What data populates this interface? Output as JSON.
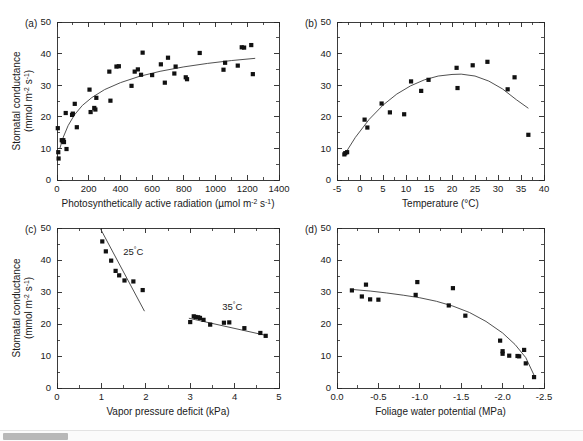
{
  "figure": {
    "background_color": "#ffffff",
    "marker_color": "#111111",
    "line_color": "#3c3c3c",
    "axis_color": "#262626",
    "shared_ylabel_line1": "Stomatal conductance",
    "shared_ylabel_line2_prefix": "(mmol m",
    "shared_ylabel_sup1": "-2",
    "shared_ylabel_mid": " s",
    "shared_ylabel_sup2": "-1",
    "shared_ylabel_suffix": ")"
  },
  "scrollbar": {
    "name": "horizontal-scrollbar",
    "thumb_left_px": 3,
    "thumb_width_px": 65,
    "track_color": "#fbfbfb",
    "thumb_color": "#b8b8b8"
  },
  "chart_data": [
    {
      "id": "panel-a",
      "type": "scatter",
      "panel_label": "(a)",
      "title": "",
      "xlabel_prefix": "Photosynthetically active radiation (",
      "xlabel_unit_mu": "µmol m",
      "xlabel_sup1": "-2",
      "xlabel_mid": " s",
      "xlabel_sup2": "-1",
      "xlabel_suffix": ")",
      "ylabel": "Stomatal conductance (mmol m-2 s-1)",
      "xlim": [
        0,
        1400
      ],
      "ylim": [
        0,
        50
      ],
      "xticks": [
        0,
        200,
        400,
        600,
        800,
        1000,
        1200,
        1400
      ],
      "xticklabels": [
        "0",
        "200",
        "400",
        "600",
        "800",
        "1000",
        "1200",
        "1400"
      ],
      "yticks": [
        0,
        10,
        20,
        30,
        40,
        50
      ],
      "yticklabels": [
        "0",
        "10",
        "20",
        "30",
        "40",
        "50"
      ],
      "grid": false,
      "legend": null,
      "points": [
        [
          5,
          16.4
        ],
        [
          8,
          8.8
        ],
        [
          10,
          6.8
        ],
        [
          30,
          12.6
        ],
        [
          36,
          12.2
        ],
        [
          40,
          12.6
        ],
        [
          44,
          12.0
        ],
        [
          55,
          21.2
        ],
        [
          60,
          9.8
        ],
        [
          95,
          20.6
        ],
        [
          100,
          21.0
        ],
        [
          112,
          24.1
        ],
        [
          125,
          16.7
        ],
        [
          205,
          28.6
        ],
        [
          212,
          21.5
        ],
        [
          235,
          22.8
        ],
        [
          242,
          22.3
        ],
        [
          248,
          26.0
        ],
        [
          330,
          34.3
        ],
        [
          337,
          25.1
        ],
        [
          375,
          35.9
        ],
        [
          390,
          36.0
        ],
        [
          470,
          29.8
        ],
        [
          490,
          34.3
        ],
        [
          510,
          35.0
        ],
        [
          530,
          33.3
        ],
        [
          540,
          40.3
        ],
        [
          600,
          33.2
        ],
        [
          655,
          36.6
        ],
        [
          680,
          30.8
        ],
        [
          700,
          38.7
        ],
        [
          740,
          33.7
        ],
        [
          748,
          35.9
        ],
        [
          812,
          32.5
        ],
        [
          820,
          31.9
        ],
        [
          900,
          40.2
        ],
        [
          1050,
          34.9
        ],
        [
          1060,
          37.1
        ],
        [
          1140,
          36.2
        ],
        [
          1165,
          42.0
        ],
        [
          1180,
          41.9
        ],
        [
          1225,
          42.7
        ],
        [
          1235,
          33.5
        ]
      ],
      "fit_curve_description": "saturating (rectangular hyperbola) rise from ~10 at 0 to ~38.5 at 1250",
      "fit_curve": [
        [
          18,
          10.0
        ],
        [
          40,
          13.6
        ],
        [
          70,
          17.2
        ],
        [
          110,
          20.6
        ],
        [
          160,
          23.6
        ],
        [
          220,
          26.1
        ],
        [
          300,
          28.6
        ],
        [
          400,
          30.8
        ],
        [
          520,
          32.8
        ],
        [
          650,
          34.4
        ],
        [
          800,
          35.8
        ],
        [
          950,
          36.9
        ],
        [
          1100,
          37.8
        ],
        [
          1250,
          38.5
        ]
      ]
    },
    {
      "id": "panel-b",
      "type": "scatter",
      "panel_label": "(b)",
      "title": "",
      "xlabel": "Temperature (°C)",
      "ylabel": "Stomatal conductance (mmol m-2 s-1)",
      "xlim": [
        -5,
        40
      ],
      "ylim": [
        0,
        50
      ],
      "xticks": [
        -5,
        0,
        5,
        10,
        15,
        20,
        25,
        30,
        35,
        40
      ],
      "xticklabels": [
        "-5",
        "0",
        "5",
        "10",
        "15",
        "20",
        "25",
        "30",
        "35",
        "40"
      ],
      "yticks": [
        0,
        10,
        20,
        30,
        40,
        50
      ],
      "yticklabels": [
        "0",
        "10",
        "20",
        "30",
        "40",
        "50"
      ],
      "grid": false,
      "legend": null,
      "points": [
        [
          -3.4,
          8.1
        ],
        [
          -3.2,
          8.5
        ],
        [
          -2.8,
          8.8
        ],
        [
          1.0,
          19.1
        ],
        [
          1.6,
          16.6
        ],
        [
          4.7,
          24.2
        ],
        [
          6.5,
          21.4
        ],
        [
          9.6,
          20.8
        ],
        [
          11.1,
          31.2
        ],
        [
          13.3,
          28.2
        ],
        [
          14.9,
          31.7
        ],
        [
          21.0,
          35.5
        ],
        [
          21.2,
          29.1
        ],
        [
          24.5,
          36.3
        ],
        [
          27.7,
          37.4
        ],
        [
          32.1,
          28.7
        ],
        [
          33.6,
          32.5
        ],
        [
          36.6,
          14.3
        ]
      ],
      "fit_curve_description": "downward parabola peaking near 21-22 degrees C at ~33.5",
      "fit_curve": [
        [
          -3.3,
          8.2
        ],
        [
          -1,
          13.5
        ],
        [
          2,
          19.2
        ],
        [
          5,
          23.7
        ],
        [
          8,
          27.2
        ],
        [
          11,
          29.8
        ],
        [
          14,
          31.7
        ],
        [
          17,
          32.9
        ],
        [
          20,
          33.4
        ],
        [
          22,
          33.5
        ],
        [
          25,
          32.9
        ],
        [
          28,
          31.3
        ],
        [
          31,
          28.8
        ],
        [
          34,
          25.4
        ],
        [
          36.6,
          22.7
        ]
      ]
    },
    {
      "id": "panel-c",
      "type": "scatter",
      "panel_label": "(c)",
      "title": "",
      "xlabel": "Vapor pressure deficit (kPa)",
      "ylabel": "Stomatal conductance (mmol m-2 s-1)",
      "xlim": [
        0,
        5
      ],
      "ylim": [
        0,
        50
      ],
      "xticks": [
        0,
        1,
        2,
        3,
        4,
        5
      ],
      "xticklabels": [
        "0",
        "1",
        "2",
        "3",
        "4",
        "5"
      ],
      "yticks": [
        0,
        10,
        20,
        30,
        40,
        50
      ],
      "yticklabels": [
        "0",
        "10",
        "20",
        "30",
        "40",
        "50"
      ],
      "grid": false,
      "annotations": [
        {
          "text": "25",
          "sup": "°",
          "tail": "C",
          "x": 1.72,
          "y": 41.5,
          "name": "annotation-25c"
        },
        {
          "text": "35",
          "sup": "°",
          "tail": "C",
          "x": 3.95,
          "y": 24.5,
          "name": "annotation-35c"
        }
      ],
      "series": [
        {
          "name": "25°C",
          "points": [
            [
              1.02,
              45.8
            ],
            [
              1.1,
              42.7
            ],
            [
              1.22,
              39.8
            ],
            [
              1.32,
              36.6
            ],
            [
              1.4,
              35.2
            ],
            [
              1.52,
              33.6
            ],
            [
              1.72,
              33.3
            ],
            [
              1.93,
              30.6
            ]
          ],
          "fit_line": [
            [
              0.97,
              50.0
            ],
            [
              1.97,
              24.0
            ]
          ]
        },
        {
          "name": "35°C",
          "points": [
            [
              3.0,
              20.6
            ],
            [
              3.08,
              22.4
            ],
            [
              3.12,
              22.2
            ],
            [
              3.18,
              22.1
            ],
            [
              3.22,
              21.9
            ],
            [
              3.3,
              21.3
            ],
            [
              3.45,
              19.8
            ],
            [
              3.76,
              20.4
            ],
            [
              3.88,
              20.5
            ],
            [
              4.22,
              18.7
            ],
            [
              4.58,
              17.2
            ],
            [
              4.7,
              16.3
            ]
          ],
          "fit_line": [
            [
              2.97,
              21.8
            ],
            [
              4.72,
              16.4
            ]
          ]
        }
      ]
    },
    {
      "id": "panel-d",
      "type": "scatter",
      "panel_label": "(d)",
      "title": "",
      "xlabel": "Foliage water potential (MPa)",
      "ylabel": "Stomatal conductance (mmol m-2 s-1)",
      "xlim": [
        0.0,
        -2.5
      ],
      "x_axis_inverted": true,
      "ylim": [
        0,
        50
      ],
      "xticks": [
        0.0,
        -0.5,
        -1.0,
        -1.5,
        -2.0,
        -2.5
      ],
      "xticklabels": [
        "0.0",
        "-0.5",
        "-1.0",
        "-1.5",
        "-2.0",
        "-2.5"
      ],
      "yticks": [
        0,
        10,
        20,
        30,
        40,
        50
      ],
      "yticklabels": [
        "0",
        "10",
        "20",
        "30",
        "40",
        "50"
      ],
      "grid": false,
      "legend": null,
      "points": [
        [
          -0.18,
          30.5
        ],
        [
          -0.3,
          28.6
        ],
        [
          -0.35,
          32.3
        ],
        [
          -0.4,
          27.7
        ],
        [
          -0.5,
          27.6
        ],
        [
          -0.97,
          33.1
        ],
        [
          -0.95,
          29.1
        ],
        [
          -1.35,
          25.8
        ],
        [
          -1.4,
          31.2
        ],
        [
          -1.55,
          22.6
        ],
        [
          -1.97,
          14.8
        ],
        [
          -2.0,
          11.5
        ],
        [
          -2.0,
          10.7
        ],
        [
          -2.08,
          10.1
        ],
        [
          -2.18,
          10.0
        ],
        [
          -2.2,
          9.9
        ],
        [
          -2.26,
          11.9
        ],
        [
          -2.28,
          7.7
        ],
        [
          -2.38,
          3.4
        ]
      ],
      "fit_curve_description": "concave decline from ~31 at -0.2 MPa to ~3.5 at -2.4 MPa",
      "fit_curve": [
        [
          -0.18,
          30.8
        ],
        [
          -0.4,
          30.3
        ],
        [
          -0.6,
          29.7
        ],
        [
          -0.8,
          29.0
        ],
        [
          -1.0,
          28.2
        ],
        [
          -1.2,
          27.1
        ],
        [
          -1.4,
          25.6
        ],
        [
          -1.6,
          23.6
        ],
        [
          -1.8,
          20.8
        ],
        [
          -2.0,
          17.2
        ],
        [
          -2.15,
          13.6
        ],
        [
          -2.28,
          9.5
        ],
        [
          -2.38,
          4.0
        ]
      ]
    }
  ]
}
